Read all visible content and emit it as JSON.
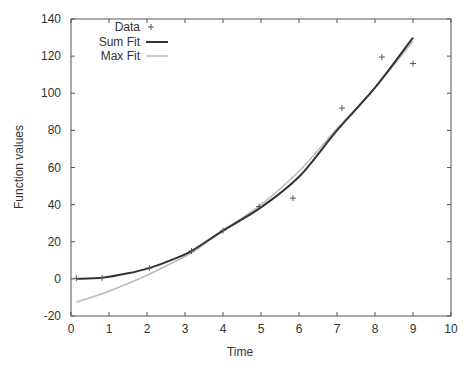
{
  "chart_data": {
    "type": "line",
    "title": "",
    "xlabel": "Time",
    "ylabel": "Function values",
    "xlim": [
      0,
      10
    ],
    "ylim": [
      -20,
      140
    ],
    "xticks": [
      0,
      1,
      2,
      3,
      4,
      5,
      6,
      7,
      8,
      9,
      10
    ],
    "yticks": [
      -20,
      0,
      20,
      40,
      60,
      80,
      100,
      120,
      140
    ],
    "grid": false,
    "legend_position": "top-left",
    "series": [
      {
        "name": "Data",
        "style": "points",
        "marker": "+",
        "color": "#555555",
        "x": [
          0.14,
          0.82,
          2.06,
          3.17,
          4.0,
          4.95,
          5.84,
          7.13,
          8.18,
          9.0
        ],
        "y": [
          0.3,
          0.6,
          5.8,
          15.0,
          26.0,
          39.0,
          43.5,
          92.0,
          119.5,
          116.0
        ]
      },
      {
        "name": "Sum Fit",
        "style": "line",
        "color": "#333333",
        "width": 2,
        "x": [
          0.14,
          0.82,
          1.5,
          2.06,
          2.6,
          3.17,
          4.0,
          5.0,
          6.0,
          7.0,
          8.0,
          9.0
        ],
        "y": [
          0.0,
          0.6,
          3.0,
          5.8,
          9.8,
          15.0,
          26.0,
          38.5,
          55.0,
          80.0,
          103.0,
          130.0
        ]
      },
      {
        "name": "Max Fit",
        "style": "line",
        "color": "#bbbbbb",
        "width": 1.5,
        "x": [
          0.14,
          0.82,
          1.5,
          2.06,
          2.6,
          3.17,
          4.0,
          5.0,
          6.0,
          7.0,
          8.0,
          9.0
        ],
        "y": [
          -12.5,
          -8.0,
          -2.5,
          2.5,
          8.0,
          14.0,
          26.0,
          40.0,
          58.0,
          81.0,
          103.0,
          128.0
        ]
      }
    ]
  },
  "legend": {
    "items": [
      {
        "label": "Data"
      },
      {
        "label": "Sum Fit"
      },
      {
        "label": "Max Fit"
      }
    ]
  },
  "axes": {
    "xlabel": "Time",
    "ylabel": "Function values"
  }
}
